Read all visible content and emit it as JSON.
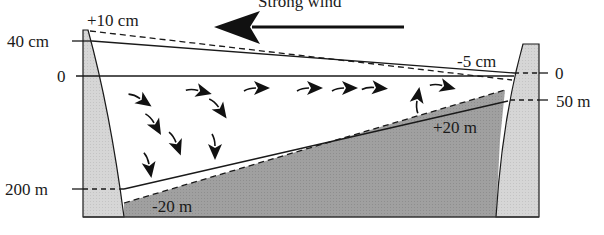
{
  "diagram": {
    "title": "Strong wind",
    "wind_direction": "left",
    "labels": {
      "surface_rise": "+10 cm",
      "surface_drop": "-5 cm",
      "left_depth_top": "40 cm",
      "left_zero": "0",
      "left_depth_bottom": "200 m",
      "right_zero": "0",
      "right_depth": "50 m",
      "thermocline_rise": "+20 m",
      "thermocline_drop": "-20 m"
    },
    "colors": {
      "wall_fill": "#d6d6d6",
      "hypolimnion_fill": "#9e9e9e",
      "line": "#1a1a1a",
      "background": "#ffffff"
    },
    "current_arrows": [
      {
        "x": 145,
        "y": 102,
        "angle": 215
      },
      {
        "x": 204,
        "y": 92,
        "angle": 195
      },
      {
        "x": 262,
        "y": 88,
        "angle": 180
      },
      {
        "x": 315,
        "y": 88,
        "angle": 180
      },
      {
        "x": 350,
        "y": 88,
        "angle": 180
      },
      {
        "x": 380,
        "y": 88,
        "angle": 185
      },
      {
        "x": 448,
        "y": 87,
        "angle": 195
      },
      {
        "x": 157,
        "y": 128,
        "angle": 240
      },
      {
        "x": 222,
        "y": 112,
        "angle": 235
      },
      {
        "x": 178,
        "y": 148,
        "angle": 250
      },
      {
        "x": 215,
        "y": 152,
        "angle": 270
      },
      {
        "x": 150,
        "y": 170,
        "angle": 260
      },
      {
        "x": 418,
        "y": 95,
        "angle": 100
      }
    ]
  }
}
